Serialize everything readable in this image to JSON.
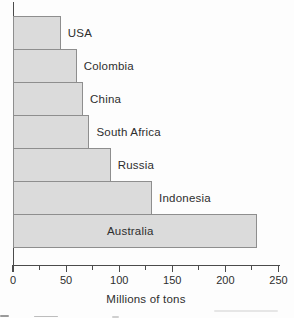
{
  "chart_data": {
    "type": "bar",
    "orientation": "horizontal",
    "title": "",
    "xlabel": "Millions of tons",
    "ylabel": "",
    "xlim": [
      0,
      250
    ],
    "x_major_ticks": [
      0,
      50,
      100,
      150,
      200,
      250
    ],
    "x_minor_ticks": [
      25,
      75,
      125,
      175,
      225
    ],
    "grid": false,
    "legend": false,
    "categories": [
      "USA",
      "Colombia",
      "China",
      "South Africa",
      "Russia",
      "Indonesia",
      "Australia"
    ],
    "values": [
      45,
      60,
      66,
      72,
      92,
      131,
      230
    ],
    "category_order": "smallest at top, largest at bottom",
    "label_placement": {
      "USA": "right-of-bar",
      "Colombia": "right-of-bar",
      "China": "right-of-bar",
      "South Africa": "right-of-bar",
      "Russia": "right-of-bar",
      "Indonesia": "right-of-bar",
      "Australia": "inside-bar"
    }
  },
  "colors": {
    "bar_fill": "#dbdbdb",
    "bar_border": "#8e8e8e",
    "axis": "#4b4b4b",
    "text": "#2e2e2e",
    "background": "#fdfdfd"
  }
}
